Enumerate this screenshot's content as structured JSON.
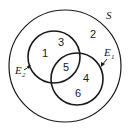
{
  "diagram": {
    "type": "venn",
    "universe": {
      "label": "S"
    },
    "sets": [
      {
        "name": "E",
        "subscript": "2",
        "elements": [
          "1",
          "3",
          "5"
        ]
      },
      {
        "name": "E",
        "subscript": "1",
        "elements": [
          "5",
          "4",
          "6"
        ]
      }
    ],
    "regions": {
      "outside": "2",
      "only_e2_a": "1",
      "only_e2_b": "3",
      "intersection": "5",
      "only_e1_a": "4",
      "only_e1_b": "6"
    }
  }
}
